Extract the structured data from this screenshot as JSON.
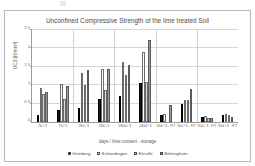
{
  "figure": {
    "title": "Unconfined Compressive Strength of the lime treated Soil",
    "xlabel": "days / lime content - storage",
    "ylabel": "UCS [N/mm²]"
  },
  "chart_data": {
    "type": "bar",
    "title": "Unconfined Compressive Strength of the lime treated Soil",
    "xlabel": "days / lime content - storage",
    "ylabel": "UCS [N/mm²]",
    "ylim": [
      0,
      2.5
    ],
    "yticks": [
      0,
      0.5,
      1,
      1.5,
      2,
      2.5
    ],
    "ytick_labels": [
      "0",
      "0.5",
      "1",
      "1.5",
      "2",
      "2.5"
    ],
    "grid": true,
    "legend_position": "bottom",
    "categories": [
      "7d / 3",
      "7d / 6",
      "28d / 3",
      "28d / 6",
      "180d / 3",
      "180d / 6",
      "56d / 3 - F/T",
      "56d / 6 - F/T",
      "90d / 3 - F/T",
      "90d / 6 - F/T"
    ],
    "series": [
      {
        "name": "Grünberg",
        "color": "#1b1b1b",
        "values": [
          0.18,
          0.34,
          0.38,
          0.62,
          0.7,
          1.06,
          0.2,
          0.5,
          0.13,
          0.18
        ]
      },
      {
        "name": "Echterdingen",
        "color": "#ffffff",
        "values": [
          0.92,
          1.02,
          1.32,
          1.45,
          1.62,
          1.9,
          0.22,
          0.6,
          0.16,
          0.22
        ]
      },
      {
        "name": "Ehrville",
        "color": "#d9d9d9",
        "values": [
          0.75,
          0.62,
          1.0,
          0.88,
          1.27,
          1.08,
          0.0,
          0.6,
          0.12,
          0.2
        ]
      },
      {
        "name": "Böhringhem",
        "color": "#9a9a9a",
        "values": [
          0.82,
          0.98,
          1.42,
          1.45,
          1.55,
          2.22,
          0.45,
          0.9,
          0.11,
          0.14
        ]
      }
    ]
  },
  "legend": [
    {
      "label": "Grünberg"
    },
    {
      "label": "Echterdingen"
    },
    {
      "label": "Ehrville"
    },
    {
      "label": "Böhringhem"
    }
  ]
}
